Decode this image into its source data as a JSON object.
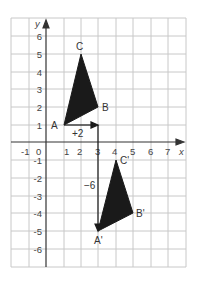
{
  "diagram": {
    "type": "coordinate-grid-translation",
    "axes": {
      "x_label": "x",
      "y_label": "y",
      "x_ticks": [
        "-1",
        "0",
        "1",
        "2",
        "3",
        "4",
        "5",
        "6",
        "7"
      ],
      "y_ticks": [
        "6",
        "5",
        "4",
        "3",
        "2",
        "1",
        "-1",
        "-2",
        "-3",
        "-4",
        "-5",
        "-6"
      ],
      "x_range": [
        -2,
        7.5
      ],
      "y_range": [
        -7,
        7
      ]
    },
    "original_triangle": {
      "vertices": [
        {
          "label": "A",
          "x": 1,
          "y": 1
        },
        {
          "label": "B",
          "x": 3,
          "y": 2
        },
        {
          "label": "C",
          "x": 2,
          "y": 5
        }
      ]
    },
    "image_triangle": {
      "vertices": [
        {
          "label": "A'",
          "x": 3,
          "y": -5
        },
        {
          "label": "B'",
          "x": 5,
          "y": -4
        },
        {
          "label": "C'",
          "x": 4,
          "y": -1
        }
      ]
    },
    "translation": {
      "horizontal_label": "+2",
      "vertical_label": "−6"
    },
    "colors": {
      "grid": "#c8c8c8",
      "axis": "#333333",
      "fill": "#1a1a1a"
    }
  }
}
